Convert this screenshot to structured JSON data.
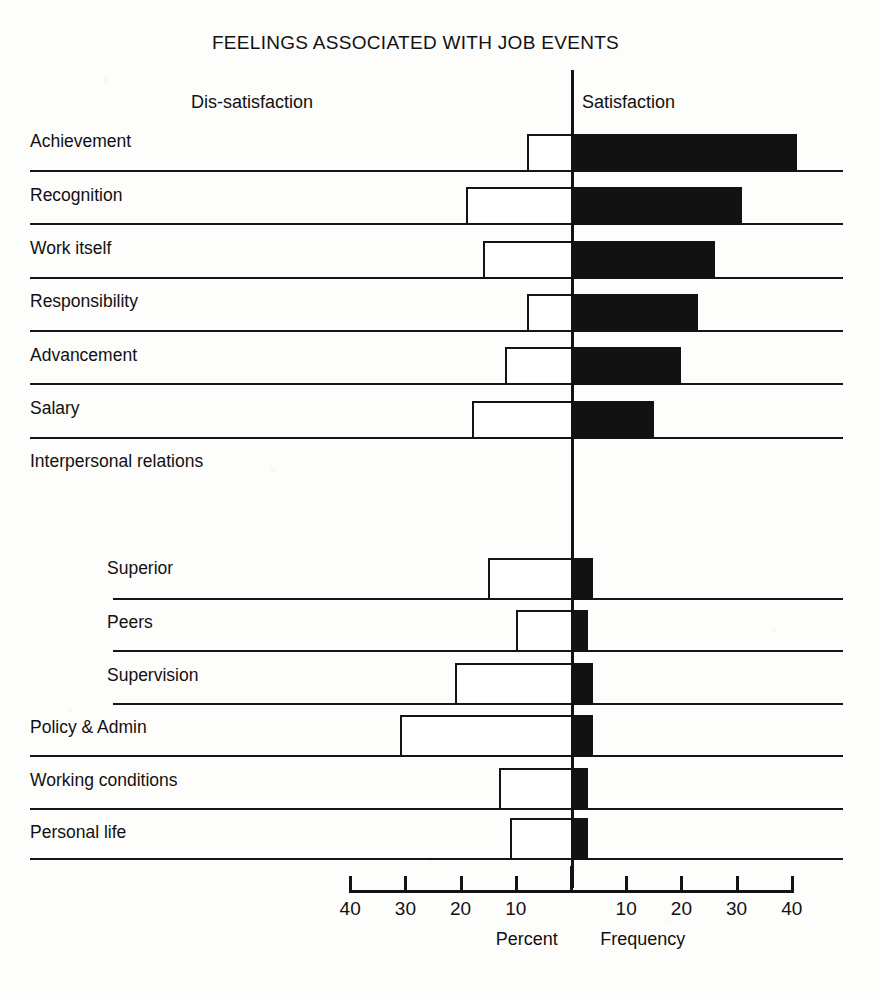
{
  "chart_data": {
    "type": "bar",
    "orientation": "horizontal-diverging",
    "title": "FEELINGS ASSOCIATED WITH JOB EVENTS",
    "xlabel_left": "Percent",
    "xlabel_right": "Frequency",
    "left_header": "Dis-satisfaction",
    "right_header": "Satisfaction",
    "grid": false,
    "legend": "none",
    "xlim": [
      -40,
      40
    ],
    "xticks": [
      40,
      30,
      20,
      10,
      0,
      10,
      20,
      30,
      40
    ],
    "xtick_labels": [
      "40",
      "30",
      "20",
      "10",
      "",
      "10",
      "20",
      "30",
      "40"
    ],
    "categories": [
      "Achievement",
      "Recognition",
      "Work itself",
      "Responsibility",
      "Advancement",
      "Salary",
      "Interpersonal relations",
      "Superior",
      "Peers",
      "Supervision",
      "Policy & Admin",
      "Working conditions",
      "Personal life"
    ],
    "series": [
      {
        "name": "Satisfaction",
        "color": "#121212",
        "values": [
          41,
          31,
          26,
          23,
          20,
          15,
          null,
          4,
          3,
          4,
          4,
          3,
          3
        ]
      },
      {
        "name": "Dis-satisfaction",
        "color": "#ffffff",
        "values": [
          8,
          19,
          16,
          8,
          12,
          18,
          null,
          15,
          10,
          21,
          31,
          13,
          11
        ]
      }
    ],
    "rows": [
      {
        "label": "Achievement",
        "indent": 0,
        "satisfaction": 41,
        "dissatisfaction": 8,
        "has_bars": true,
        "rule_indent": 0
      },
      {
        "label": "Recognition",
        "indent": 0,
        "satisfaction": 31,
        "dissatisfaction": 19,
        "has_bars": true,
        "rule_indent": 0
      },
      {
        "label": "Work itself",
        "indent": 0,
        "satisfaction": 26,
        "dissatisfaction": 16,
        "has_bars": true,
        "rule_indent": 0
      },
      {
        "label": "Responsibility",
        "indent": 0,
        "satisfaction": 23,
        "dissatisfaction": 8,
        "has_bars": true,
        "rule_indent": 0
      },
      {
        "label": "Advancement",
        "indent": 0,
        "satisfaction": 20,
        "dissatisfaction": 12,
        "has_bars": true,
        "rule_indent": 0
      },
      {
        "label": "Salary",
        "indent": 0,
        "satisfaction": 15,
        "dissatisfaction": 18,
        "has_bars": true,
        "rule_indent": 0
      },
      {
        "label": "Interpersonal relations",
        "indent": 0,
        "satisfaction": null,
        "dissatisfaction": null,
        "has_bars": false,
        "rule_indent": null
      },
      {
        "label": "Superior",
        "indent": 1,
        "satisfaction": 4,
        "dissatisfaction": 15,
        "has_bars": true,
        "rule_indent": 1
      },
      {
        "label": "Peers",
        "indent": 1,
        "satisfaction": 3,
        "dissatisfaction": 10,
        "has_bars": true,
        "rule_indent": 1
      },
      {
        "label": "Supervision",
        "indent": 1,
        "satisfaction": 4,
        "dissatisfaction": 21,
        "has_bars": true,
        "rule_indent": 1
      },
      {
        "label": "Policy & Admin",
        "indent": 0,
        "satisfaction": 4,
        "dissatisfaction": 31,
        "has_bars": true,
        "rule_indent": 0
      },
      {
        "label": "Working conditions",
        "indent": 0,
        "satisfaction": 3,
        "dissatisfaction": 13,
        "has_bars": true,
        "rule_indent": 0
      },
      {
        "label": "Personal life",
        "indent": 0,
        "satisfaction": 3,
        "dissatisfaction": 11,
        "has_bars": true,
        "rule_indent": 0
      }
    ]
  },
  "layout": {
    "zero_x": 571,
    "px_per_percent": 5.52,
    "axis_left_x": 352,
    "axis_right_x": 793,
    "label_x": 30,
    "label_indent_x": 107,
    "rule_right_x": 843,
    "rule_indent_x": 113,
    "row_ys": [
      170,
      223,
      277,
      330,
      383,
      437,
      490,
      598,
      650,
      703,
      755,
      808,
      858
    ],
    "label_ys": [
      131,
      185,
      238,
      291,
      345,
      398,
      451,
      558,
      612,
      665,
      717,
      770,
      822
    ],
    "bar_height": 38,
    "bar_height_small": 42
  }
}
